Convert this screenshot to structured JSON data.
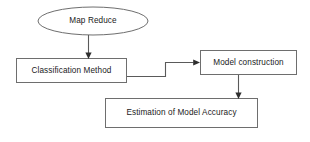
{
  "diagram": {
    "background_color": "#ffffff",
    "shape_stroke_color": "#6e6e6e",
    "connector_color": "#5a5a5a",
    "text_color": "#1a1a1a",
    "nodes": [
      {
        "id": "map-reduce",
        "label": "Map Reduce",
        "shape": "ellipse",
        "x": 38,
        "y": 7,
        "width": 110,
        "height": 28
      },
      {
        "id": "classification-method",
        "label": "Classification Method",
        "shape": "rectangle",
        "x": 16,
        "y": 58,
        "width": 111,
        "height": 25
      },
      {
        "id": "model-construction",
        "label": "Model construction",
        "shape": "rectangle",
        "x": 200,
        "y": 50,
        "width": 97,
        "height": 25
      },
      {
        "id": "estimation-of-model-accuracy",
        "label": "Estimation of Model Accuracy",
        "shape": "rectangle",
        "x": 105,
        "y": 98,
        "width": 153,
        "height": 30
      }
    ],
    "connectors": [
      {
        "id": "map-reduce-to-classification",
        "from": "map-reduce",
        "to": "classification-method",
        "style": "straight-vertical-arrow"
      },
      {
        "id": "classification-to-model-construction",
        "from": "classification-method",
        "to": "model-construction",
        "style": "stepped-horizontal-arrow"
      },
      {
        "id": "model-construction-to-estimation",
        "from": "model-construction",
        "to": "estimation-of-model-accuracy",
        "style": "straight-vertical-arrow"
      }
    ]
  }
}
